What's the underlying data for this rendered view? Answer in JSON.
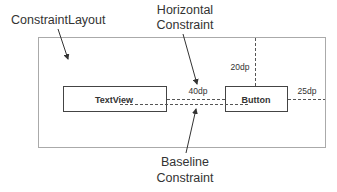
{
  "diagram": {
    "colors": {
      "container_stroke": "#aaaaaa",
      "box_stroke": "#444444",
      "dash_stroke": "#555555",
      "arrow": "#333333",
      "text": "#333333"
    },
    "labels": {
      "constraint_layout": "ConstraintLayout",
      "horizontal_line1": "Horizontal",
      "horizontal_line2": "Constraint",
      "baseline_line1": "Baseline",
      "baseline_line2": "Constraint"
    },
    "widgets": {
      "textview": "TextView",
      "button": "Button"
    },
    "dimensions": {
      "top_margin": "20dp",
      "horizontal_gap": "40dp",
      "right_margin": "25dp"
    }
  }
}
